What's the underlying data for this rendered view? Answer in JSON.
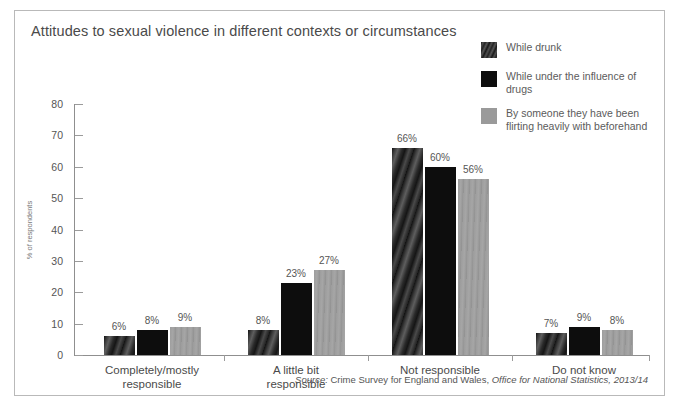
{
  "chart_data": {
    "type": "bar",
    "title": "Attitudes to sexual violence in different contexts or circumstances",
    "xlabel": "",
    "ylabel": "% of respondents",
    "ylim": [
      0,
      80
    ],
    "yticks": [
      0,
      10,
      20,
      30,
      40,
      50,
      60,
      70,
      80
    ],
    "grid": false,
    "legend_position": "top-right",
    "categories": [
      "Completely/mostly\nresponsible",
      "A little bit\nresponsible",
      "Not responsible",
      "Do not know"
    ],
    "category_lines": [
      [
        "Completely/mostly",
        "responsible"
      ],
      [
        "A little bit",
        "responsible"
      ],
      [
        "Not responsible",
        ""
      ],
      [
        "Do not know",
        ""
      ]
    ],
    "series": [
      {
        "name": "While drunk",
        "swatch": "hatched-dark",
        "color": "#3a3a3a",
        "values": [
          6,
          8,
          66,
          7
        ],
        "labels": [
          "6%",
          "8%",
          "66%",
          "7%"
        ]
      },
      {
        "name": "While under the influence of drugs",
        "swatch": "solid-black",
        "color": "#0d0d0d",
        "values": [
          8,
          23,
          60,
          9
        ],
        "labels": [
          "8%",
          "23%",
          "60%",
          "9%"
        ]
      },
      {
        "name": "By someone they have been flirting heavily with beforehand",
        "swatch": "solid-gray",
        "color": "#9a9a9a",
        "values": [
          9,
          27,
          56,
          8
        ],
        "labels": [
          "9%",
          "27%",
          "56%",
          "8%"
        ]
      }
    ]
  },
  "legend": {
    "items": [
      {
        "label_line1": "While drunk",
        "label_line2": ""
      },
      {
        "label_line1": "While under the influence of drugs",
        "label_line2": ""
      },
      {
        "label_line1": "By someone they have been",
        "label_line2": "flirting heavily with beforehand"
      }
    ]
  },
  "source": {
    "prefix": "Source:",
    "body": " Crime Survey for England and Wales, ",
    "publisher": "Office for National Statistics, 2013/14"
  }
}
